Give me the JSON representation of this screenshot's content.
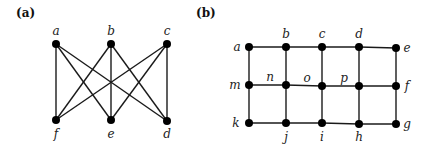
{
  "figure": {
    "panels": [
      {
        "id": "a",
        "label": "(a)",
        "label_pos": [
          16,
          17
        ],
        "node_radius": 4,
        "nodes": [
          {
            "id": "a",
            "label": "a",
            "x": 56,
            "y": 44,
            "lx": 56,
            "ly": 35,
            "anchor": "middle"
          },
          {
            "id": "b",
            "label": "b",
            "x": 111,
            "y": 44,
            "lx": 111,
            "ly": 35,
            "anchor": "middle"
          },
          {
            "id": "c",
            "label": "c",
            "x": 167,
            "y": 44,
            "lx": 167,
            "ly": 35,
            "anchor": "middle"
          },
          {
            "id": "f",
            "label": "f",
            "x": 56,
            "y": 120,
            "lx": 56,
            "ly": 138,
            "anchor": "middle"
          },
          {
            "id": "e",
            "label": "e",
            "x": 111,
            "y": 120,
            "lx": 111,
            "ly": 138,
            "anchor": "middle"
          },
          {
            "id": "d",
            "label": "d",
            "x": 167,
            "y": 121,
            "lx": 167,
            "ly": 138,
            "anchor": "middle"
          }
        ],
        "edges": [
          [
            "a",
            "f"
          ],
          [
            "a",
            "e"
          ],
          [
            "a",
            "d"
          ],
          [
            "b",
            "f"
          ],
          [
            "b",
            "e"
          ],
          [
            "b",
            "d"
          ],
          [
            "c",
            "f"
          ],
          [
            "c",
            "e"
          ],
          [
            "c",
            "d"
          ]
        ]
      },
      {
        "id": "b",
        "label": "(b)",
        "label_pos": [
          196,
          17
        ],
        "node_radius": 4,
        "nodes": [
          {
            "id": "a",
            "label": "a",
            "x": 249,
            "y": 47,
            "lx": 237,
            "ly": 51,
            "anchor": "middle"
          },
          {
            "id": "b",
            "label": "b",
            "x": 286,
            "y": 47,
            "lx": 286,
            "ly": 38,
            "anchor": "middle"
          },
          {
            "id": "c",
            "label": "c",
            "x": 322,
            "y": 47,
            "lx": 322,
            "ly": 38,
            "anchor": "middle"
          },
          {
            "id": "d",
            "label": "d",
            "x": 359,
            "y": 47,
            "lx": 359,
            "ly": 38,
            "anchor": "middle"
          },
          {
            "id": "e",
            "label": "e",
            "x": 396,
            "y": 48,
            "lx": 407,
            "ly": 52,
            "anchor": "middle"
          },
          {
            "id": "m",
            "label": "m",
            "x": 249,
            "y": 85,
            "lx": 235,
            "ly": 89,
            "anchor": "middle"
          },
          {
            "id": "n",
            "label": "n",
            "x": 286,
            "y": 85,
            "lx": 270,
            "ly": 81,
            "anchor": "middle"
          },
          {
            "id": "o",
            "label": "o",
            "x": 322,
            "y": 86,
            "lx": 307,
            "ly": 82,
            "anchor": "middle"
          },
          {
            "id": "p",
            "label": "p",
            "x": 359,
            "y": 86,
            "lx": 344,
            "ly": 82,
            "anchor": "middle"
          },
          {
            "id": "f",
            "label": "f",
            "x": 396,
            "y": 86,
            "lx": 407,
            "ly": 90,
            "anchor": "middle"
          },
          {
            "id": "k",
            "label": "k",
            "x": 249,
            "y": 123,
            "lx": 236,
            "ly": 127,
            "anchor": "middle"
          },
          {
            "id": "j",
            "label": "j",
            "x": 286,
            "y": 123,
            "lx": 286,
            "ly": 141,
            "anchor": "middle"
          },
          {
            "id": "i",
            "label": "i",
            "x": 322,
            "y": 123,
            "lx": 322,
            "ly": 141,
            "anchor": "middle"
          },
          {
            "id": "h",
            "label": "h",
            "x": 359,
            "y": 124,
            "lx": 359,
            "ly": 141,
            "anchor": "middle"
          },
          {
            "id": "g",
            "label": "g",
            "x": 396,
            "y": 124,
            "lx": 407,
            "ly": 128,
            "anchor": "middle"
          }
        ],
        "edges": [
          [
            "a",
            "b"
          ],
          [
            "b",
            "c"
          ],
          [
            "c",
            "d"
          ],
          [
            "d",
            "e"
          ],
          [
            "m",
            "n"
          ],
          [
            "n",
            "o"
          ],
          [
            "o",
            "p"
          ],
          [
            "p",
            "f"
          ],
          [
            "k",
            "j"
          ],
          [
            "j",
            "i"
          ],
          [
            "i",
            "h"
          ],
          [
            "h",
            "g"
          ],
          [
            "a",
            "m"
          ],
          [
            "m",
            "k"
          ],
          [
            "b",
            "n"
          ],
          [
            "n",
            "j"
          ],
          [
            "c",
            "o"
          ],
          [
            "o",
            "i"
          ],
          [
            "d",
            "p"
          ],
          [
            "p",
            "h"
          ],
          [
            "e",
            "f"
          ],
          [
            "f",
            "g"
          ]
        ]
      }
    ]
  }
}
